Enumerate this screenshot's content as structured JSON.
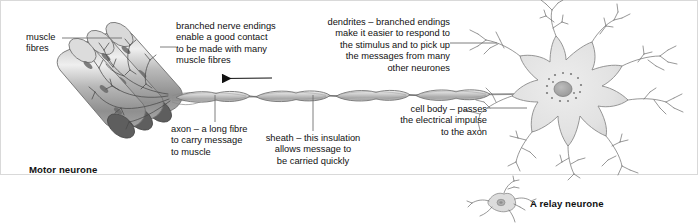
{
  "diagram": {
    "title_motor": "Motor neurone",
    "title_relay": "A relay neurone",
    "labels": {
      "muscle_fibres": "muscle\nfibres",
      "branched_nerve_endings": "branched nerve endings\nenable a good contact\nto be made with many\nmuscle fibres",
      "dendrites": "dendrites – branched endings\nmake it easier to respond to\nthe stimulus and to pick up\nthe messages from many\nother  neurones",
      "axon": "axon – a long fibre\nto carry message\nto muscle",
      "sheath": "sheath – this insulation\nallows message to\nbe carried quickly",
      "cell_body": "cell body – passes\nthe electrical impulse\nto the axon"
    },
    "parts": [
      "muscle-fibres",
      "branched-nerve-endings",
      "axon",
      "myelin-sheath",
      "node-of-ranvier",
      "cell-body",
      "nucleus",
      "dendrites",
      "impulse-direction-arrow",
      "relay-neurone"
    ],
    "colors": {
      "ink": "#3c3c3c",
      "fibre_fill": "#b6b6b6",
      "fibre_dark": "#6e6e6e",
      "sheath_fill": "#c9c9c9",
      "soma_fill": "#e2e2e2",
      "nucleus_fill": "#a9a9a9",
      "frame": "#d9d9d9",
      "leader": "#6f6f6f"
    }
  }
}
